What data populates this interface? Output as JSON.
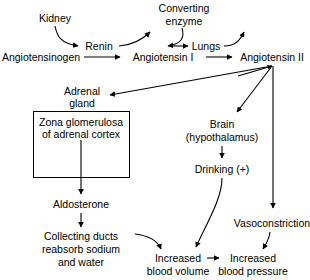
{
  "diagram": {
    "background_color": "#ffffff",
    "line_color": "#000000",
    "text_color": "#000000",
    "nodes": {
      "kidney": "Kidney",
      "renin": "Renin",
      "converting_enzyme_line1": "Converting",
      "converting_enzyme_line2": "enzyme",
      "angiotensinogen": "Angiotensinogen",
      "angiotensin_i": "Angiotensin I",
      "lungs": "Lungs",
      "angiotensin_ii": "Angiotensin II",
      "adrenal_gland_line1": "Adrenal",
      "adrenal_gland_line2": "gland",
      "zona_box_line1": "Zona glomerulosa",
      "zona_box_line2": "of adrenal cortex",
      "aldosterone": "Aldosterone",
      "collecting_ducts_line1": "Collecting ducts",
      "collecting_ducts_line2": "reabsorb sodium",
      "collecting_ducts_line3": "and water",
      "brain_line1": "Brain",
      "brain_line2": "(hypothalamus)",
      "drinking": "Drinking (+)",
      "vasoconstriction": "Vasoconstriction",
      "increased_blood_volume_line1": "Increased",
      "increased_blood_volume_line2": "blood volume",
      "increased_blood_pressure_line1": "Increased",
      "increased_blood_pressure_line2": "blood pressure"
    },
    "edges": [
      {
        "name": "kidney-to-renin",
        "from": "kidney",
        "to": "renin"
      },
      {
        "name": "angiotensinogen-to-angiotensin-i",
        "from": "angiotensinogen",
        "to": "angiotensin_i"
      },
      {
        "name": "renin-to-converting-enzyme",
        "from": "renin",
        "to": "converting_enzyme"
      },
      {
        "name": "converting-enzyme-to-angiotensin-i",
        "from": "converting_enzyme",
        "to": "angiotensin_i"
      },
      {
        "name": "angiotensin-i-to-angiotensin-ii",
        "from": "angiotensin_i",
        "to": "angiotensin_ii"
      },
      {
        "name": "lungs-to-converting-enzyme",
        "from": "lungs",
        "to": "converting_enzyme"
      },
      {
        "name": "angiotensin-ii-to-lungs",
        "from": "angiotensin_ii",
        "to": "lungs"
      },
      {
        "name": "angiotensin-ii-to-adrenal-gland",
        "from": "angiotensin_ii",
        "to": "adrenal_gland"
      },
      {
        "name": "angiotensin-ii-to-brain",
        "from": "angiotensin_ii",
        "to": "brain"
      },
      {
        "name": "angiotensin-ii-to-vasoconstriction",
        "from": "angiotensin_ii",
        "to": "vasoconstriction"
      },
      {
        "name": "zona-box-to-aldosterone",
        "from": "zona_box",
        "to": "aldosterone"
      },
      {
        "name": "aldosterone-to-collecting-ducts",
        "from": "aldosterone",
        "to": "collecting_ducts"
      },
      {
        "name": "collecting-ducts-to-increased-blood-volume",
        "from": "collecting_ducts",
        "to": "increased_blood_volume"
      },
      {
        "name": "brain-to-drinking",
        "from": "brain",
        "to": "drinking"
      },
      {
        "name": "drinking-to-increased-blood-volume",
        "from": "drinking",
        "to": "increased_blood_volume"
      },
      {
        "name": "increased-blood-volume-to-increased-blood-pressure",
        "from": "increased_blood_volume",
        "to": "increased_blood_pressure"
      },
      {
        "name": "vasoconstriction-to-increased-blood-pressure",
        "from": "vasoconstriction",
        "to": "increased_blood_pressure"
      }
    ]
  }
}
